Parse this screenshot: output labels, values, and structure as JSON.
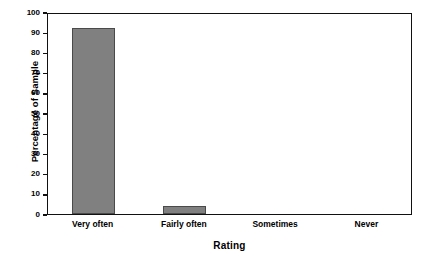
{
  "chart_data": {
    "type": "bar",
    "title": "",
    "subtitle": "",
    "xlabel": "Rating",
    "ylabel": "Percentage of Sample",
    "categories": [
      "Very often",
      "Fairly often",
      "Sometimes",
      "Never"
    ],
    "values": [
      92,
      4,
      0,
      0
    ],
    "series": [
      {
        "name": "Percentage of Sample",
        "values": [
          92,
          4,
          0,
          0
        ]
      }
    ],
    "ylim": [
      0,
      100
    ],
    "ytick_labels": [
      "0",
      "10",
      "20",
      "30",
      "40",
      "50",
      "60",
      "70",
      "80",
      "90",
      "100"
    ],
    "ytick_values": [
      0,
      10,
      20,
      30,
      40,
      50,
      60,
      70,
      80,
      90,
      100
    ],
    "grid": false,
    "legend": false,
    "legend_position": "none",
    "annotations": [],
    "colors": {
      "bar_fill": "#808080",
      "bar_border": "#4a4a4a",
      "axis": "#111111",
      "text": "#000000",
      "background": "#ffffff"
    }
  }
}
